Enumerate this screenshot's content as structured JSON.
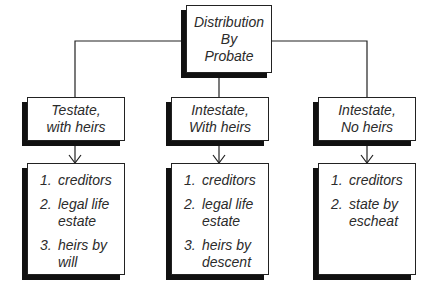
{
  "diagram": {
    "root": {
      "lines": [
        "Distribution",
        "By",
        "Probate"
      ]
    },
    "branches": [
      {
        "header": {
          "lines": [
            "Testate,",
            "with heirs"
          ]
        },
        "items": [
          {
            "num": "1.",
            "text": "creditors"
          },
          {
            "num": "2.",
            "text": "legal life\nestate"
          },
          {
            "num": "3.",
            "text": "heirs by\nwill"
          }
        ]
      },
      {
        "header": {
          "lines": [
            "Intestate,",
            "With heirs"
          ]
        },
        "items": [
          {
            "num": "1.",
            "text": "creditors"
          },
          {
            "num": "2.",
            "text": "legal life\nestate"
          },
          {
            "num": "3.",
            "text": "heirs by\ndescent"
          }
        ]
      },
      {
        "header": {
          "lines": [
            "Intestate,",
            "No heirs"
          ]
        },
        "items": [
          {
            "num": "1.",
            "text": "creditors"
          },
          {
            "num": "2.",
            "text": "state by\nescheat"
          }
        ]
      }
    ],
    "colors": {
      "line": "#222222",
      "shadow": "#111111",
      "text": "#2b2b2b"
    }
  }
}
